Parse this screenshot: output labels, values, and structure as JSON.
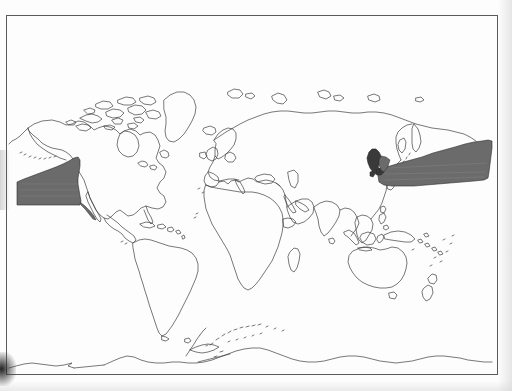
{
  "figure": {
    "kind": "world-distribution-map",
    "title": "",
    "caption": "",
    "projection": "cylindrical",
    "background_color": "#fdfdfd",
    "border": {
      "color": "#5a5a5a",
      "width_px": 1,
      "x": 6,
      "y": 15,
      "w": 491,
      "h": 359
    },
    "coastline": {
      "stroke_color": "#3f3f3f",
      "stroke_width_px": 0.7,
      "fill": "none"
    },
    "shading": {
      "range_fill_color": "#6b6b6b",
      "landmass_highlight_color": "#3a3a3a",
      "stroke_color": "#2e2e2e"
    },
    "scan_artifacts": [
      {
        "name": "bottom-left-smudge",
        "color": "#101010"
      },
      {
        "name": "left-edge-band",
        "color": "#787878"
      },
      {
        "name": "right-page-shadow",
        "color": "#cdcdcd"
      }
    ]
  },
  "chart_data": {
    "type": "map",
    "title": "",
    "xlabel": "",
    "ylabel": "",
    "projection": "cylindrical equirectangular (world)",
    "grid": false,
    "legend_position": "none",
    "series": [
      {
        "name": "Shaded distribution range",
        "fill_color": "#6b6b6b",
        "regions": [
          {
            "name": "eastern-north-pacific-range",
            "description": "Wedge-shaped shaded band off the western coast of North America, widening westward from the Baja California / Mexican coast into the open eastern North Pacific and reaching the western map edge.",
            "approx_bbox": [
              15,
              155,
              82,
              207
            ]
          },
          {
            "name": "western-north-pacific-range",
            "description": "Long tapering shaded band extending east from Japan across the North Pacific toward the eastern map edge near the date line.",
            "approx_bbox": [
              378,
              140,
              493,
              190
            ]
          }
        ]
      },
      {
        "name": "Highlighted landmass",
        "fill_color": "#3a3a3a",
        "regions": [
          {
            "name": "japan-archipelago",
            "description": "Japanese islands filled solid dark, at the western terminus of the western North Pacific shaded band.",
            "approx_bbox": [
              368,
              148,
              389,
              178
            ]
          }
        ]
      }
    ],
    "landmasses": [
      "North America",
      "Greenland",
      "South America",
      "Europe",
      "Africa",
      "Asia",
      "Australia",
      "New Zealand",
      "Antarctica (coastline)",
      "Iceland",
      "Madagascar",
      "Japan",
      "Indonesia",
      "Philippines",
      "British Isles",
      "Caribbean islands",
      "Pacific islands"
    ],
    "annotations": []
  }
}
